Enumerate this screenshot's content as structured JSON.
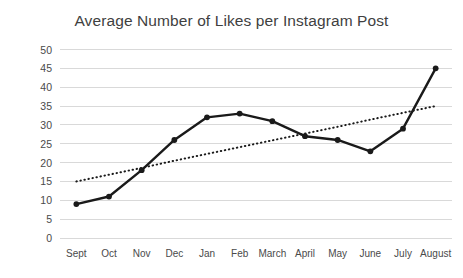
{
  "chart_data": {
    "type": "line",
    "title": "Average Number of Likes per Instagram Post",
    "xlabel": "",
    "ylabel": "",
    "categories": [
      "Sept",
      "Oct",
      "Nov",
      "Dec",
      "Jan",
      "Feb",
      "March",
      "April",
      "May",
      "June",
      "July",
      "August"
    ],
    "series": [
      {
        "name": "Average likes per post",
        "values": [
          9,
          11,
          18,
          26,
          32,
          33,
          31,
          27,
          26,
          23,
          29,
          45
        ],
        "style": "solid-with-markers",
        "color": "#1a1a1a"
      },
      {
        "name": "Linear trendline",
        "values": [
          15,
          16.8,
          18.6,
          20.5,
          22.3,
          24.1,
          25.9,
          27.7,
          29.5,
          31.4,
          33.2,
          35
        ],
        "style": "dotted",
        "color": "#1a1a1a"
      }
    ],
    "ylim": [
      0,
      50
    ],
    "yticks": [
      0,
      5,
      10,
      15,
      20,
      25,
      30,
      35,
      40,
      45,
      50
    ],
    "ytick_labels": [
      "0",
      "5",
      "10",
      "15",
      "20",
      "25",
      "30",
      "35",
      "40",
      "45",
      "50"
    ],
    "grid": "horizontal",
    "gridline_color": "#d9d9d9",
    "legend": "none",
    "background": "#ffffff"
  }
}
